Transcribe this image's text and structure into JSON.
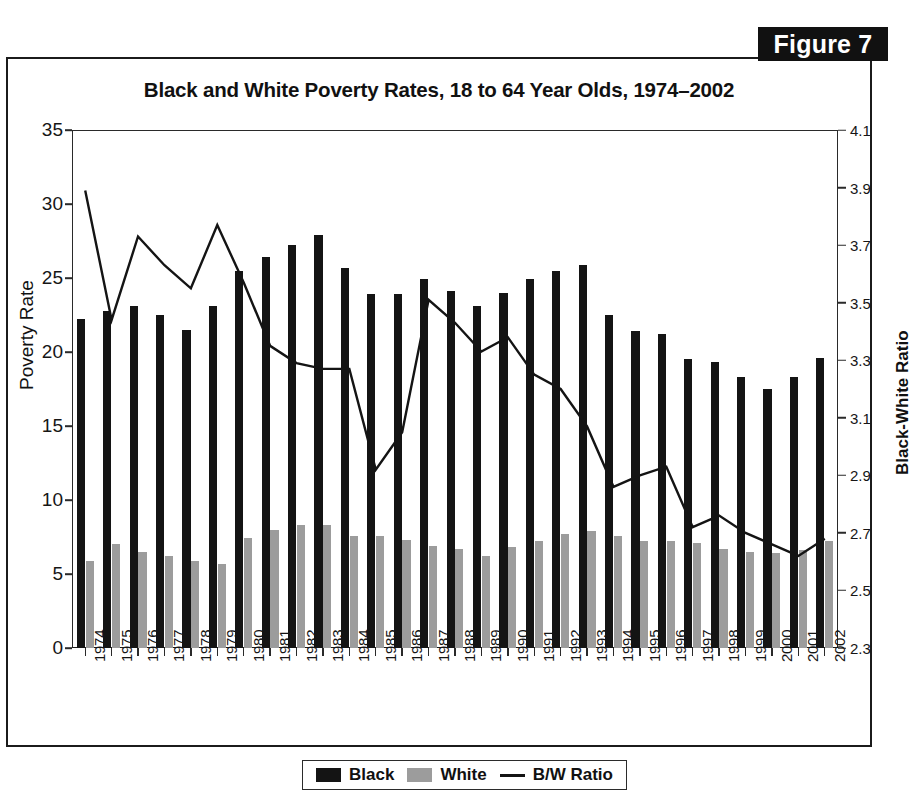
{
  "figure": {
    "badge_label": "Figure 7"
  },
  "chart_data": {
    "type": "bar",
    "title": "Black and White Poverty Rates, 18 to 64 Year Olds, 1974–2002",
    "xlabel": "",
    "ylabel": "Poverty Rate",
    "ylabel_right": "Black-White Ratio",
    "ylim": [
      0,
      35
    ],
    "ylim_right": [
      2.3,
      4.1
    ],
    "yticks": [
      "0",
      "5",
      "10",
      "15",
      "20",
      "25",
      "30",
      "35"
    ],
    "ytick_values": [
      0,
      5,
      10,
      15,
      20,
      25,
      30,
      35
    ],
    "yticks_right": [
      "2.3",
      "2.5",
      "2.7",
      "2.9",
      "3.1",
      "3.3",
      "3.5",
      "3.7",
      "3.9",
      "4.1"
    ],
    "ytick_values_right": [
      2.3,
      2.5,
      2.7,
      2.9,
      3.1,
      3.3,
      3.5,
      3.7,
      3.9,
      4.1
    ],
    "grid": false,
    "legend_position": "below-figure",
    "categories": [
      "1974",
      "1975",
      "1976",
      "1977",
      "1978",
      "1979",
      "1980",
      "1981",
      "1982",
      "1983",
      "1984",
      "1985",
      "1986",
      "1987",
      "1988",
      "1989",
      "1990",
      "1991",
      "1992",
      "1993",
      "1994",
      "1995",
      "1996",
      "1997",
      "1998",
      "1999",
      "2000",
      "2001",
      "2002"
    ],
    "series": [
      {
        "name": "Black",
        "kind": "bar",
        "axis": "left",
        "color": "#141414",
        "values": [
          22.2,
          22.8,
          23.1,
          22.5,
          21.5,
          23.1,
          25.5,
          26.4,
          27.2,
          27.9,
          25.7,
          23.9,
          23.9,
          24.9,
          24.1,
          23.1,
          24.0,
          24.9,
          25.5,
          25.9,
          22.5,
          21.4,
          21.2,
          19.5,
          19.3,
          18.3,
          17.5,
          18.3,
          19.6
        ]
      },
      {
        "name": "White",
        "kind": "bar",
        "axis": "left",
        "color": "#9c9c9c",
        "values": [
          5.9,
          7.0,
          6.5,
          6.2,
          5.9,
          5.7,
          7.4,
          8.0,
          8.3,
          8.3,
          7.6,
          7.6,
          7.3,
          6.9,
          6.7,
          6.2,
          6.8,
          7.2,
          7.7,
          7.9,
          7.6,
          7.2,
          7.2,
          7.1,
          6.7,
          6.5,
          6.4,
          6.6,
          7.2
        ]
      },
      {
        "name": "B/W Ratio",
        "kind": "line",
        "axis": "right",
        "color": "#141414",
        "values": [
          3.89,
          3.44,
          3.73,
          3.63,
          3.55,
          3.77,
          3.57,
          3.35,
          3.29,
          3.27,
          3.27,
          2.92,
          3.05,
          3.51,
          3.43,
          3.33,
          3.38,
          3.25,
          3.2,
          3.07,
          2.86,
          2.9,
          2.93,
          2.72,
          2.76,
          2.7,
          2.66,
          2.62,
          2.68
        ]
      }
    ]
  },
  "legend": {
    "items": [
      {
        "label": "Black",
        "marker": "swatch-dark"
      },
      {
        "label": "White",
        "marker": "swatch-gray"
      },
      {
        "label": "B/W Ratio",
        "marker": "line"
      }
    ]
  }
}
